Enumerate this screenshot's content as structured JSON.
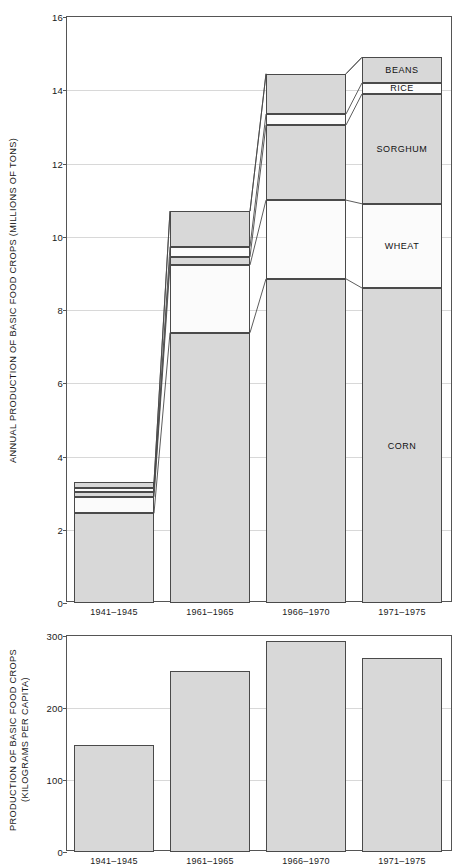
{
  "chart_data": [
    {
      "type": "bar",
      "id": "annual-production",
      "title": "",
      "ylabel": "ANNUAL PRODUCTION OF BASIC FOOD CROPS (MILLIONS OF TONS)",
      "xlabel": "",
      "ylim": [
        0,
        16
      ],
      "yticks": [
        0,
        2,
        4,
        6,
        8,
        10,
        12,
        14,
        16
      ],
      "grid": true,
      "stacked": true,
      "categories": [
        "1941–1945",
        "1961–1965",
        "1966–1970",
        "1971–1975"
      ],
      "series": [
        {
          "name": "CORN",
          "style": "fill",
          "values": [
            2.45,
            7.38,
            8.85,
            8.6
          ]
        },
        {
          "name": "WHEAT",
          "style": "open",
          "values": [
            0.45,
            1.85,
            2.15,
            2.3
          ]
        },
        {
          "name": "SORGHUM",
          "style": "fill",
          "values": [
            0.12,
            0.22,
            2.05,
            3.0
          ]
        },
        {
          "name": "RICE",
          "style": "open",
          "values": [
            0.13,
            0.28,
            0.3,
            0.3
          ]
        },
        {
          "name": "BEANS",
          "style": "fill",
          "values": [
            0.15,
            0.97,
            1.1,
            0.7
          ]
        }
      ],
      "totals": [
        3.3,
        10.7,
        14.45,
        14.9
      ],
      "labelled_stack_index": 3
    },
    {
      "type": "bar",
      "id": "per-capita-production",
      "title": "",
      "ylabel": "PRODUCTION OF BASIC FOOD CROPS\n(KILOGRAMS PER CAPITA)",
      "xlabel": "",
      "ylim": [
        0,
        300
      ],
      "yticks": [
        0,
        100,
        200,
        300
      ],
      "grid": true,
      "stacked": false,
      "categories": [
        "1941–1945",
        "1961–1965",
        "1966–1970",
        "1971–1975"
      ],
      "values": [
        149,
        251,
        293,
        269
      ]
    }
  ]
}
